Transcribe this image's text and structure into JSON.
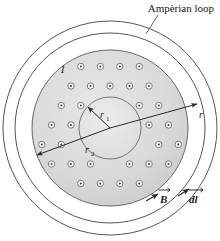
{
  "figure": {
    "title_label": "Ampèrian loop",
    "type": "coaxial-cable-cross-section"
  },
  "labels": {
    "amperian_loop": "Ampèrian loop",
    "current": "I",
    "r1": "r",
    "r1_sub": "1",
    "r2": "r",
    "r2_sub": "2",
    "r": "r",
    "b_field": "B",
    "dl": "dl"
  },
  "colors": {
    "stroke": "#4d4d4d",
    "stroke_dark": "#333333",
    "conductor_fill": "#d8d8d8",
    "core_fill": "#e4e4e4",
    "background": "#ffffff",
    "dot_fill": "#ffffff",
    "text": "#1a1a1a"
  },
  "geometry": {
    "center_x": 110,
    "center_y": 128,
    "circles": [
      {
        "name": "amperian-loop-outer",
        "r": 107
      },
      {
        "name": "outer-shield",
        "r": 95
      },
      {
        "name": "conductor-outer-r2",
        "r": 78
      },
      {
        "name": "conductor-inner-r1",
        "r": 31
      }
    ],
    "dot_radius": 3.2,
    "dot_core_radius": 1.0
  },
  "chart_data": {
    "type": "diagram",
    "title": "Ampèrian loop",
    "annotations": [
      {
        "text": "Ampèrian loop",
        "role": "leader-label",
        "points_to": "outermost-circle"
      },
      {
        "text": "I",
        "role": "current-label",
        "points_to": "conductor-dots"
      },
      {
        "text": "r₁",
        "role": "radius-label",
        "value_of": "inner-core-radius"
      },
      {
        "text": "r₂",
        "role": "radius-label",
        "value_of": "conductor-outer-radius"
      },
      {
        "text": "r",
        "role": "radius-label",
        "value_of": "amperian-loop-radius"
      },
      {
        "text": "B⃗",
        "role": "vector-label",
        "points_to": "amperian-loop-tangent"
      },
      {
        "text": "dl⃗",
        "role": "vector-label",
        "points_to": "amperian-loop-tangent"
      }
    ]
  }
}
